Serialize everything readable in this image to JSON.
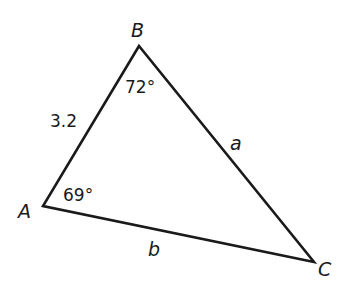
{
  "diagram": {
    "type": "triangle",
    "vertices": {
      "A": {
        "label": "A",
        "angle": "69°"
      },
      "B": {
        "label": "B",
        "angle": "72°"
      },
      "C": {
        "label": "C"
      }
    },
    "sides": {
      "AB": {
        "label": "3.2"
      },
      "BC": {
        "label": "a"
      },
      "AC": {
        "label": "b"
      }
    },
    "colors": {
      "stroke": "#1a1a1a",
      "background": "#ffffff"
    }
  }
}
